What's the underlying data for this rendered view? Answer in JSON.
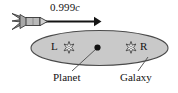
{
  "figure": {
    "background_color": "#ffffff",
    "ink_color": "#141414"
  },
  "speed_arrow": {
    "value": "0.999",
    "unit": "c",
    "full_label": "0.999c",
    "direction": "right",
    "arrow_color": "#141414"
  },
  "rocket": {
    "name": "rocket",
    "body_color": "#b5b5b5",
    "outline_color": "#2b2b2b",
    "nose_color": "#cfcfcf",
    "fin_color": "#8f8f8f"
  },
  "galaxy": {
    "label": "Galaxy",
    "fill_color": "#c9c9c9",
    "outline_color": "#4a4a4a"
  },
  "planet": {
    "label": "Planet",
    "dot_color": "#111111"
  },
  "stars": [
    {
      "id": "star-left",
      "label": "L",
      "label_side": "left",
      "glyph": "star-burst-icon",
      "fill_color": "#f2f2f2",
      "outline_color": "#3a3a3a"
    },
    {
      "id": "star-right",
      "label": "R",
      "label_side": "right",
      "glyph": "star-burst-icon",
      "fill_color": "#f2f2f2",
      "outline_color": "#3a3a3a"
    }
  ],
  "leader_lines": [
    {
      "id": "planet-leader",
      "from": "Planet",
      "to": "planet-dot"
    },
    {
      "id": "galaxy-leader",
      "from": "Galaxy",
      "to": "galaxy-ellipse-edge"
    }
  ]
}
